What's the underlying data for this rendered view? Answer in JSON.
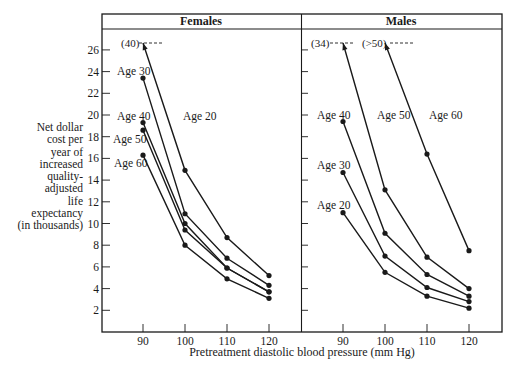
{
  "chart_data": {
    "type": "line",
    "title": "",
    "xlabel": "Pretreatment diastolic blood pressure (mm Hg)",
    "ylabel": "Net dollar cost per year of increased quality-adjusted life expectancy (in thousands)",
    "ylabel_lines": [
      "Net dollar",
      "cost per",
      "year of",
      "increased",
      "quality-",
      "adjusted",
      "life",
      "expectancy",
      "(in thousands)"
    ],
    "x_ticks": [
      90,
      100,
      110,
      120
    ],
    "y_ticks": [
      2,
      4,
      6,
      8,
      10,
      12,
      14,
      16,
      18,
      20,
      22,
      24,
      26
    ],
    "ylim": [
      0,
      28
    ],
    "xlim": [
      80,
      127
    ],
    "grid": false,
    "legend": "none (series labeled inline)",
    "panels": [
      {
        "title": "Females",
        "off_scale_labels": [
          {
            "text": "(40)",
            "series": "Age 20",
            "x": 90
          }
        ],
        "series": [
          {
            "name": "Age 20",
            "x": [
              90,
              100,
              110,
              120
            ],
            "values": [
              40,
              14.9,
              8.7,
              5.2
            ],
            "off_scale_start": true
          },
          {
            "name": "Age 30",
            "x": [
              90,
              100,
              110,
              120
            ],
            "values": [
              23.4,
              10.9,
              6.8,
              4.3
            ]
          },
          {
            "name": "Age 40",
            "x": [
              90,
              100,
              110,
              120
            ],
            "values": [
              19.3,
              10.0,
              5.9,
              3.7
            ]
          },
          {
            "name": "Age 50",
            "x": [
              90,
              100,
              110,
              120
            ],
            "values": [
              18.6,
              9.4,
              5.9,
              3.7
            ]
          },
          {
            "name": "Age 60",
            "x": [
              90,
              100,
              110,
              120
            ],
            "values": [
              16.3,
              8.0,
              4.9,
              3.1
            ]
          }
        ]
      },
      {
        "title": "Males",
        "off_scale_labels": [
          {
            "text": "(34)",
            "series": "Age 50",
            "x": 90
          },
          {
            "text": "(>50)",
            "series": "Age 60",
            "x": 100
          }
        ],
        "series": [
          {
            "name": "Age 20",
            "x": [
              90,
              100,
              110,
              120
            ],
            "values": [
              11.0,
              5.5,
              3.3,
              2.2
            ]
          },
          {
            "name": "Age 30",
            "x": [
              90,
              100,
              110,
              120
            ],
            "values": [
              14.7,
              7.0,
              4.1,
              2.8
            ]
          },
          {
            "name": "Age 40",
            "x": [
              90,
              100,
              110,
              120
            ],
            "values": [
              19.4,
              9.1,
              5.3,
              3.3
            ]
          },
          {
            "name": "Age 50",
            "x": [
              90,
              100,
              110,
              120
            ],
            "values": [
              34,
              13.1,
              6.9,
              4.0
            ],
            "off_scale_start": true
          },
          {
            "name": "Age 60",
            "x": [
              100,
              110,
              120
            ],
            "values": [
              50,
              16.4,
              7.5
            ],
            "off_scale_start": true
          }
        ]
      }
    ]
  },
  "labels": {
    "females": "Females",
    "males": "Males",
    "xlabel": "Pretreatment diastolic blood pressure (mm Hg)",
    "f_off": "(40)",
    "m_off1": "(34)",
    "m_off2": "(>50)",
    "f_age20": "Age 20",
    "f_age30": "Age 30",
    "f_age40": "Age 40",
    "f_age50": "Age 50",
    "f_age60": "Age 60",
    "m_age20": "Age 20",
    "m_age30": "Age 30",
    "m_age40": "Age 40",
    "m_age50": "Age 50",
    "m_age60": "Age 60"
  },
  "style": {
    "ink": "#1a1a1a",
    "background": "#ffffff"
  }
}
